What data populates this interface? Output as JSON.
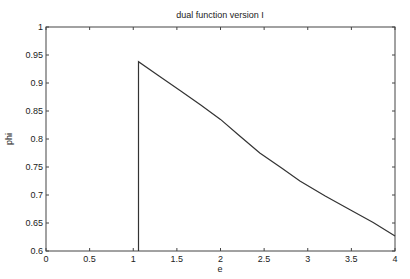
{
  "chart_data": {
    "type": "line",
    "title": "dual function version I",
    "xlabel": "e",
    "ylabel": "phi",
    "xlim": [
      0,
      4
    ],
    "ylim": [
      0.6,
      1.0
    ],
    "grid": false,
    "legend": null,
    "x_ticks": [
      0,
      0.5,
      1,
      1.5,
      2,
      2.5,
      3,
      3.5,
      4
    ],
    "x_tick_labels": [
      "0",
      "0.5",
      "1",
      "1.5",
      "2",
      "2.5",
      "3",
      "3.5",
      "4"
    ],
    "y_ticks": [
      0.6,
      0.65,
      0.7,
      0.75,
      0.8,
      0.85,
      0.9,
      0.95,
      1.0
    ],
    "y_tick_labels": [
      "0.6",
      "0.65",
      "0.7",
      "0.75",
      "0.8",
      "0.85",
      "0.9",
      "0.95",
      "1"
    ],
    "series": [
      {
        "name": "phi(e)",
        "color": "#333333",
        "x": [
          1.06,
          1.06,
          1.3,
          1.54,
          1.77,
          2.0,
          2.2,
          2.45,
          2.7,
          2.91,
          3.2,
          3.49,
          3.75,
          4.0
        ],
        "y": [
          0.6,
          0.938,
          0.912,
          0.886,
          0.861,
          0.835,
          0.808,
          0.775,
          0.748,
          0.725,
          0.698,
          0.673,
          0.651,
          0.627
        ]
      }
    ]
  }
}
